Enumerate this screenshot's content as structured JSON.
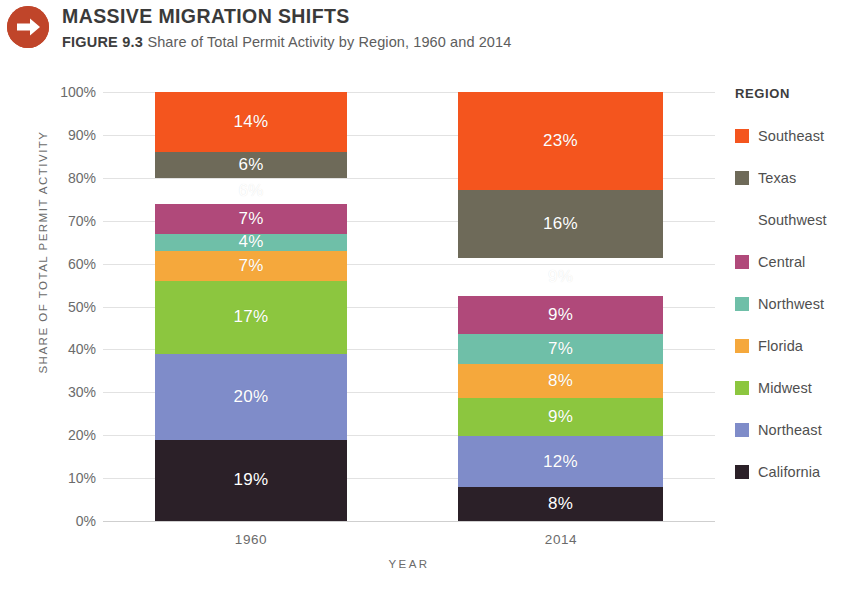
{
  "header": {
    "icon": "arrow-right-circle-icon",
    "title": "MASSIVE MIGRATION SHIFTS",
    "figure_number": "FIGURE 9.3",
    "caption": "Share of Total Permit Activity by Region, 1960 and 2014"
  },
  "legend": {
    "title": "REGION"
  },
  "chart_data": {
    "type": "bar",
    "stacked": true,
    "stacked_mode": "percent",
    "title": "MASSIVE MIGRATION SHIFTS",
    "subtitle": "Share of Total Permit Activity by Region, 1960 and 2014",
    "xlabel": "YEAR",
    "ylabel": "SHARE OF TOTAL PERMIT ACTIVITY",
    "categories": [
      "1960",
      "2014"
    ],
    "ylim": [
      0,
      100
    ],
    "ytick_labels": [
      "100%",
      "90%",
      "80%",
      "70%",
      "60%",
      "50%",
      "40%",
      "30%",
      "20%",
      "10%",
      "0%"
    ],
    "ytick_values": [
      100,
      90,
      80,
      70,
      60,
      50,
      40,
      30,
      20,
      10,
      0
    ],
    "grid": true,
    "legend_position": "right",
    "series": [
      {
        "name": "Southeast",
        "color": "#F4551E",
        "values": [
          14,
          23
        ],
        "labels": [
          "14%",
          "23%"
        ]
      },
      {
        "name": "Texas",
        "color": "#6E6A59",
        "values": [
          6,
          16
        ],
        "labels": [
          "6%",
          "16%"
        ]
      },
      {
        "name": "Southwest",
        "color": "#D9C githubA",
        "values": [
          6,
          9
        ],
        "labels": [
          "6%",
          "9%"
        ]
      },
      {
        "name": "Central",
        "color": "#B0497A",
        "values": [
          7,
          9
        ],
        "labels": [
          "7%",
          "9%"
        ]
      },
      {
        "name": "Northwest",
        "color": "#6FBFA8",
        "values": [
          4,
          7
        ],
        "labels": [
          "4%",
          "7%"
        ]
      },
      {
        "name": "Florida",
        "color": "#F5A83C",
        "values": [
          7,
          8
        ],
        "labels": [
          "7%",
          "8%"
        ]
      },
      {
        "name": "Midwest",
        "color": "#8CC63F",
        "values": [
          17,
          9
        ],
        "labels": [
          "17%",
          "9%"
        ]
      },
      {
        "name": "Northeast",
        "color": "#7F8CC9",
        "values": [
          20,
          12
        ],
        "labels": [
          "20%",
          "12%"
        ]
      },
      {
        "name": "California",
        "color": "#2B2028",
        "values": [
          19,
          8
        ],
        "labels": [
          "19%",
          "8%"
        ]
      }
    ]
  }
}
